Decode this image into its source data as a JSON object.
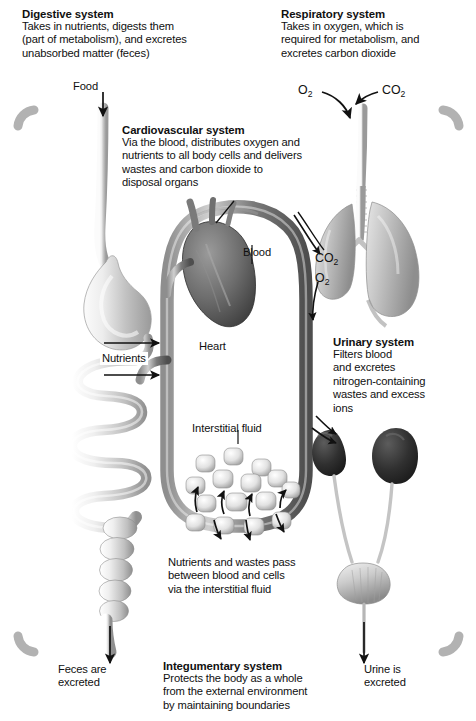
{
  "figure": {
    "type": "physiology-concept-diagram"
  },
  "callouts": {
    "digestive": {
      "heading": "Digestive system",
      "lines": [
        "Takes in nutrients, digests them",
        "(part of metabolism), and excretes",
        "unabsorbed matter (feces)"
      ]
    },
    "respiratory": {
      "heading": "Respiratory system",
      "lines": [
        "Takes in oxygen, which is",
        "required for metabolism, and",
        "excretes carbon dioxide"
      ]
    },
    "cardiovascular": {
      "heading": "Cardiovascular system",
      "lines": [
        "Via the blood, distributes oxygen and",
        "nutrients to all body cells and delivers",
        "wastes and carbon dioxide to",
        "disposal organs"
      ]
    },
    "urinary": {
      "heading": "Urinary system",
      "lines": [
        "Filters blood",
        "and excretes",
        "nitrogen-containing",
        "wastes and excess",
        "ions"
      ]
    },
    "integumentary": {
      "heading": "Integumentary system",
      "lines": [
        "Protects the body as a whole",
        "from the external environment",
        "by maintaining boundaries"
      ]
    }
  },
  "labels": {
    "food": "Food",
    "blood": "Blood",
    "heart": "Heart",
    "nutrients": "Nutrients",
    "interstitial_fluid": "Interstitial fluid",
    "feces": [
      "Feces are",
      "excreted"
    ],
    "urine": [
      "Urine is",
      "excreted"
    ],
    "exchange_note": [
      "Nutrients and wastes pass",
      "between blood and cells",
      "via the interstitial fluid"
    ]
  },
  "gases": {
    "oxygen": "O",
    "oxygen_sub": "2",
    "carbon_dioxide": "CO",
    "carbon_dioxide_sub": "2",
    "top_left_label": "O2",
    "top_right_label": "CO2",
    "lung_co2_label": "CO2",
    "lung_o2_label": "O2"
  },
  "colors": {
    "background": "#ffffff",
    "text": "#101010",
    "skin_border": "#b4b4b4",
    "skin_border_dark": "#8d8d8d",
    "vessel_dark": "#6b6b6b",
    "vessel_light": "#c9c9c9",
    "organ_light": "#d9d9d9",
    "organ_mid": "#a8a8a8",
    "organ_dark": "#3c3c3c",
    "kidney": "#2e2e2e",
    "arrow": "#111111"
  },
  "organs": [
    {
      "name": "esophagus-and-stomach",
      "system": "digestive"
    },
    {
      "name": "small-intestine",
      "system": "digestive"
    },
    {
      "name": "large-intestine",
      "system": "digestive"
    },
    {
      "name": "trachea",
      "system": "respiratory"
    },
    {
      "name": "lungs",
      "system": "respiratory"
    },
    {
      "name": "heart",
      "system": "cardiovascular"
    },
    {
      "name": "blood-vessel-loop",
      "system": "cardiovascular"
    },
    {
      "name": "kidneys",
      "system": "urinary"
    },
    {
      "name": "ureters",
      "system": "urinary"
    },
    {
      "name": "urinary-bladder",
      "system": "urinary"
    },
    {
      "name": "tissue-cells",
      "system": "interstitial"
    },
    {
      "name": "skin-boundary",
      "system": "integumentary"
    }
  ]
}
